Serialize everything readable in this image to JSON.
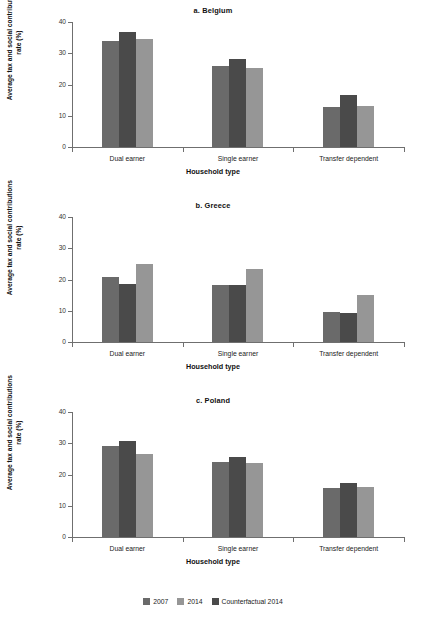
{
  "chart_data": {
    "type": "bar",
    "title": "",
    "xlabel": "Household type",
    "ylabel": "Average tax and social contributions rate (%)",
    "ylim": [
      0,
      40
    ],
    "yticks": [
      0,
      10,
      20,
      30,
      40
    ],
    "grid": false,
    "legend_position": "bottom",
    "categories": [
      "Dual earner",
      "Single earner",
      "Transfer dependent"
    ],
    "series_order_drawn": [
      "2007",
      "Counterfactual 2014",
      "2014"
    ],
    "series_colors": {
      "2007": "#6a6a6a",
      "2014": "#969696",
      "Counterfactual 2014": "#4a4a4a"
    },
    "panels": [
      {
        "key": "belgium",
        "title": "a. Belgium",
        "series": [
          {
            "name": "2007",
            "values": [
              34.0,
              25.8,
              12.8
            ]
          },
          {
            "name": "Counterfactual 2014",
            "values": [
              36.8,
              28.2,
              16.7
            ]
          },
          {
            "name": "2014",
            "values": [
              34.5,
              25.2,
              13.0
            ]
          }
        ]
      },
      {
        "key": "greece",
        "title": "b. Greece",
        "series": [
          {
            "name": "2007",
            "values": [
              20.9,
              18.4,
              9.5
            ]
          },
          {
            "name": "Counterfactual 2014",
            "values": [
              18.5,
              18.4,
              9.2
            ]
          },
          {
            "name": "2014",
            "values": [
              24.9,
              23.4,
              15.1
            ]
          }
        ]
      },
      {
        "key": "poland",
        "title": "c. Poland",
        "series": [
          {
            "name": "2007",
            "values": [
              29.0,
              24.0,
              15.6
            ]
          },
          {
            "name": "Counterfactual 2014",
            "values": [
              30.6,
              25.6,
              17.2
            ]
          },
          {
            "name": "2014",
            "values": [
              26.7,
              23.7,
              15.9
            ]
          }
        ]
      }
    ],
    "legend": [
      {
        "label": "2007",
        "color": "#6a6a6a"
      },
      {
        "label": "2014",
        "color": "#969696"
      },
      {
        "label": "Counterfactual 2014",
        "color": "#4a4a4a"
      }
    ]
  }
}
